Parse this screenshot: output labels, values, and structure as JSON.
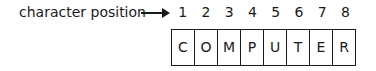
{
  "label": "character position",
  "arrow_icon": "right-arrow",
  "positions": [
    "1",
    "2",
    "3",
    "4",
    "5",
    "6",
    "7",
    "8"
  ],
  "characters": [
    "C",
    "O",
    "M",
    "P",
    "U",
    "T",
    "E",
    "R"
  ]
}
